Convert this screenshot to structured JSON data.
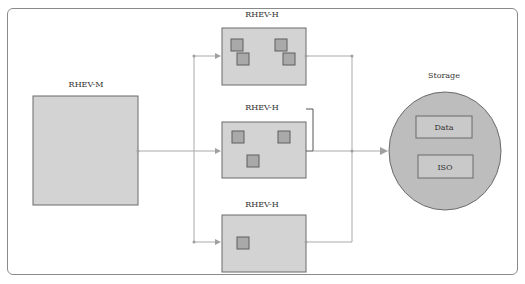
{
  "diagram": {
    "manager": {
      "label": "RHEV-M"
    },
    "hosts": [
      {
        "label": "RHEV-H",
        "vm_count": 4
      },
      {
        "label": "RHEV-H",
        "vm_count": 3
      },
      {
        "label": "RHEV-H",
        "vm_count": 1
      }
    ],
    "storage": {
      "label": "Storage",
      "domains": [
        {
          "label": "Data"
        },
        {
          "label": "ISO"
        }
      ]
    },
    "colors": {
      "box_fill": "#d3d3d3",
      "vm_fill": "#a9a9a9",
      "storage_fill": "#bdbdbd",
      "connector": "#a9a9a9"
    }
  }
}
